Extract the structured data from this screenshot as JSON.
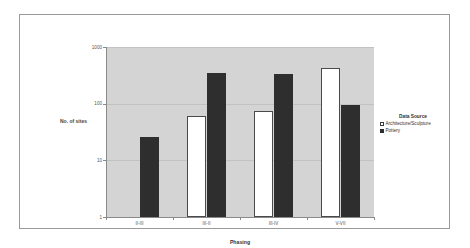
{
  "chart_data": {
    "type": "bar",
    "title": "",
    "xlabel": "Phasing",
    "ylabel": "No. of sites",
    "categories": [
      "II-III",
      "III-II",
      "III-IV",
      "V-VII"
    ],
    "yscale": "log",
    "ylim": [
      1,
      1000
    ],
    "yticks": [
      "1000",
      "100",
      "10",
      "1"
    ],
    "ytick_values": [
      1000,
      100,
      10,
      1
    ],
    "grid": true,
    "legend_position": "right",
    "legend_title": "Data Source",
    "series": [
      {
        "name": "Architecture/Sculpture",
        "color": "#ffffff",
        "values": [
          null,
          61,
          75,
          420
        ]
      },
      {
        "name": "Pottery",
        "color": "#2e2e2e",
        "values": [
          26,
          345,
          330,
          96
        ]
      }
    ]
  },
  "axes": {
    "y_title": "No. of sites",
    "x_title": "Phasing"
  },
  "legend": {
    "title": "Data Source",
    "entries": [
      {
        "label": "Architecture/Sculpture",
        "marker": "hollow-square"
      },
      {
        "label": "Pottery",
        "marker": "filled-square"
      }
    ]
  }
}
